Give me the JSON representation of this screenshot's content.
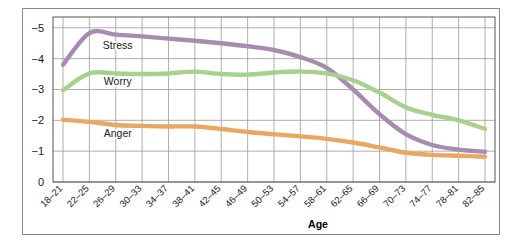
{
  "chart_data": {
    "type": "line",
    "title": "",
    "xlabel": "Age",
    "ylabel": "",
    "categories": [
      "18-21",
      "22-25",
      "26-29",
      "30-33",
      "34-37",
      "38-41",
      "42-45",
      "46-49",
      "50-53",
      "54-57",
      "58-61",
      "62-65",
      "66-69",
      "70-73",
      "74-77",
      "78-81",
      "82-85"
    ],
    "ytick_labels": [
      "-5",
      "-4",
      "-3",
      "-2",
      "-1",
      "0"
    ],
    "ytick_values": [
      -5,
      -4,
      -3,
      -2,
      -1,
      0
    ],
    "ylim": [
      0,
      -5.35
    ],
    "y_axis_direction": "negative-up",
    "grid": true,
    "legend_position": "inline-labels",
    "series": [
      {
        "name": "Stress",
        "color": "#a78cb0",
        "label_x_category": "26-29",
        "values": [
          -3.8,
          -4.83,
          -4.78,
          -4.72,
          -4.65,
          -4.58,
          -4.5,
          -4.4,
          -4.28,
          -4.05,
          -3.7,
          -3.0,
          -2.2,
          -1.55,
          -1.2,
          -1.05,
          -0.98
        ]
      },
      {
        "name": "Worry",
        "color": "#a9d18e",
        "label_x_category": "26-29",
        "values": [
          -2.98,
          -3.52,
          -3.52,
          -3.5,
          -3.52,
          -3.58,
          -3.5,
          -3.48,
          -3.55,
          -3.58,
          -3.52,
          -3.3,
          -2.9,
          -2.42,
          -2.18,
          -2.0,
          -1.72
        ]
      },
      {
        "name": "Anger",
        "color": "#e8a863",
        "label_x_category": "26-29",
        "values": [
          -2.02,
          -1.95,
          -1.85,
          -1.82,
          -1.8,
          -1.8,
          -1.72,
          -1.62,
          -1.55,
          -1.48,
          -1.4,
          -1.28,
          -1.12,
          -0.95,
          -0.88,
          -0.85,
          -0.82
        ]
      }
    ]
  }
}
